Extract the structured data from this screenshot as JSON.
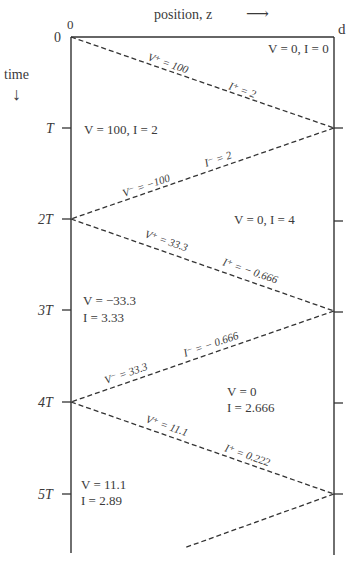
{
  "axes": {
    "position_label": "position, z",
    "position_arrow": "⟶",
    "time_label": "time",
    "time_arrow": "↓",
    "z_start": "0",
    "z_end": "d"
  },
  "time_ticks": [
    {
      "label": "0"
    },
    {
      "label": "T"
    },
    {
      "label": "2T"
    },
    {
      "label": "3T"
    },
    {
      "label": "4T"
    },
    {
      "label": "5T"
    }
  ],
  "wave_labels": [
    {
      "v": "V⁺ = 100",
      "i": "I⁺ = 2"
    },
    {
      "v": "V⁻ = −100",
      "i": "I⁻ = 2"
    },
    {
      "v": "V⁺ = 33.3",
      "i": "I⁺ = − 0.666"
    },
    {
      "v": "V⁻ = 33.3",
      "i": "I⁻ = − 0.666"
    },
    {
      "v": "V⁺ = 11.1",
      "i": "I⁺ = 0.222"
    }
  ],
  "regions": [
    {
      "line1": "V = 0, I = 0"
    },
    {
      "line1": "V = 100, I = 2"
    },
    {
      "line1": "V = 0, I = 4"
    },
    {
      "line1": "V = −33.3",
      "line2": "I = 3.33"
    },
    {
      "line1": "V = 0",
      "line2": "I = 2.666"
    },
    {
      "line1": "V = 11.1",
      "line2": "I = 2.89"
    }
  ],
  "colors": {
    "line": "#333333",
    "text": "#3a3a3a",
    "background": "#ffffff"
  }
}
